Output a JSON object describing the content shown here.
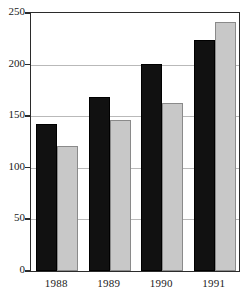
{
  "chart_data": {
    "type": "bar",
    "title": "",
    "subtitle": "",
    "xlabel": "",
    "ylabel": "",
    "categories": [
      "1988",
      "1989",
      "1990",
      "1991"
    ],
    "series": [
      {
        "name": "Series 1",
        "color": "#111111",
        "values": [
          142,
          169,
          201,
          224
        ]
      },
      {
        "name": "Series 2",
        "color": "#c8c8c8",
        "values": [
          121,
          146,
          163,
          241
        ]
      }
    ],
    "ylim": [
      0,
      250
    ],
    "ytick_values": [
      0,
      50,
      100,
      150,
      200,
      250
    ],
    "ytick_labels": [
      "0",
      "50",
      "100",
      "150",
      "200",
      "250"
    ],
    "grid": true,
    "grid_axis": "y",
    "legend": false,
    "legend_position": "none",
    "frame": true,
    "annotations": []
  }
}
